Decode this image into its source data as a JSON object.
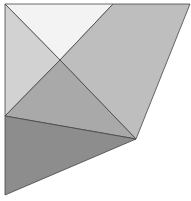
{
  "diagram": {
    "type": "geometric-polygon-decomposition",
    "width": 191,
    "height": 201,
    "stroke": "#444444",
    "vertices": {
      "A": [
        5,
        4
      ],
      "B": [
        113,
        4
      ],
      "C": [
        190,
        4
      ],
      "X": [
        60,
        60
      ],
      "D": [
        5,
        116
      ],
      "E": [
        136,
        139
      ],
      "F": [
        5,
        195
      ]
    },
    "regions": [
      {
        "name": "top-triangle",
        "points": "5,4 113,4 60,60",
        "fill": "#f3f3f3"
      },
      {
        "name": "left-triangle",
        "points": "5,4 60,60 5,116",
        "fill": "#d2d2d2"
      },
      {
        "name": "right-parallelogram",
        "points": "113,4 190,4 136,139 60,60",
        "fill": "#bebebe"
      },
      {
        "name": "middle-triangle",
        "points": "60,60 136,139 5,116",
        "fill": "#a9a9a9"
      },
      {
        "name": "bottom-triangle",
        "points": "5,116 136,139 5,195",
        "fill": "#8d8d8d"
      }
    ]
  }
}
